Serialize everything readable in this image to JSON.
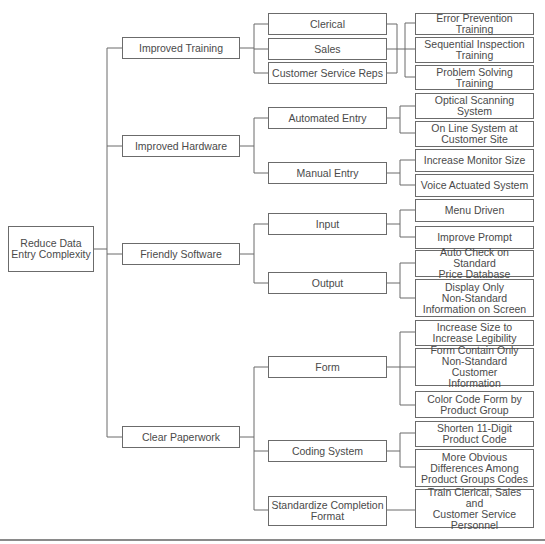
{
  "diagram": {
    "type": "tree-diagram",
    "root": {
      "label": "Reduce Data\nEntry Complexity"
    },
    "level1": [
      {
        "label": "Improved Training"
      },
      {
        "label": "Improved Hardware"
      },
      {
        "label": "Friendly Software"
      },
      {
        "label": "Clear Paperwork"
      }
    ],
    "level2": [
      {
        "label": "Clerical",
        "parent": "Improved Training"
      },
      {
        "label": "Sales",
        "parent": "Improved Training"
      },
      {
        "label": "Customer Service Reps",
        "parent": "Improved Training"
      },
      {
        "label": "Automated Entry",
        "parent": "Improved Hardware"
      },
      {
        "label": "Manual Entry",
        "parent": "Improved Hardware"
      },
      {
        "label": "Input",
        "parent": "Friendly Software"
      },
      {
        "label": "Output",
        "parent": "Friendly Software"
      },
      {
        "label": "Form",
        "parent": "Clear Paperwork"
      },
      {
        "label": "Coding System",
        "parent": "Clear Paperwork"
      },
      {
        "label": "Standardize Completion\nFormat",
        "parent": "Clear Paperwork"
      }
    ],
    "level3": [
      {
        "label": "Error Prevention Training",
        "parent": "Clerical/Sales/Customer Service Reps"
      },
      {
        "label": "Sequential Inspection\nTraining",
        "parent": "Clerical/Sales/Customer Service Reps"
      },
      {
        "label": "Problem Solving\nTraining",
        "parent": "Clerical/Sales/Customer Service Reps"
      },
      {
        "label": "Optical Scanning\nSystem",
        "parent": "Automated Entry"
      },
      {
        "label": "On Line System at\nCustomer Site",
        "parent": "Automated Entry"
      },
      {
        "label": "Increase Monitor Size",
        "parent": "Manual Entry"
      },
      {
        "label": "Voice Actuated System",
        "parent": "Manual Entry"
      },
      {
        "label": "Menu Driven",
        "parent": "Input"
      },
      {
        "label": "Improve Prompt",
        "parent": "Input"
      },
      {
        "label": "Auto Check on Standard\nPrice Database",
        "parent": "Output"
      },
      {
        "label": "Display Only\nNon-Standard\nInformation on Screen",
        "parent": "Output"
      },
      {
        "label": "Increase Size to\nIncrease Legibility",
        "parent": "Form"
      },
      {
        "label": "Form Contain Only\nNon-Standard Customer\nInformation",
        "parent": "Form"
      },
      {
        "label": "Color Code Form by\nProduct Group",
        "parent": "Form"
      },
      {
        "label": "Shorten 11-Digit\nProduct Code",
        "parent": "Coding System"
      },
      {
        "label": "More Obvious\nDifferences Among\nProduct Groups Codes",
        "parent": "Coding System"
      },
      {
        "label": "Train Clerical, Sales and\nCustomer Service\nPersonnel",
        "parent": "Standardize Completion Format"
      }
    ]
  }
}
